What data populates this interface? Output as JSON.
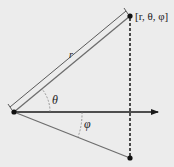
{
  "diagram": {
    "background": "#ececec",
    "colors": {
      "axis": "#1a1a1a",
      "vector": "#6e6e6e",
      "point": "#111111",
      "dashed": "#222222"
    },
    "labels": {
      "point": "[r, θ, φ]",
      "radius": "r",
      "theta": "θ",
      "phi": "φ"
    },
    "points": [
      {
        "name": "origin",
        "x": 14,
        "y": 112
      },
      {
        "name": "point-r-theta-phi",
        "x": 130,
        "y": 16
      },
      {
        "name": "projection-point",
        "x": 130,
        "y": 158
      }
    ]
  }
}
